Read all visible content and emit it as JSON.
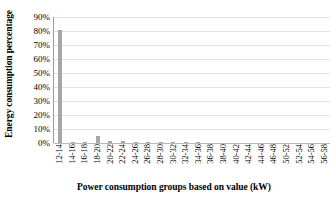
{
  "chart_data": {
    "type": "bar",
    "title": "",
    "subtitle": "",
    "xlabel": "Power consumption groups based on value (kW)",
    "ylabel": "Energy consumption percentage",
    "ylim": [
      0,
      90
    ],
    "ytick_labels": [
      "0%",
      "10%",
      "20%",
      "30%",
      "40%",
      "50%",
      "60%",
      "70%",
      "80%",
      "90%"
    ],
    "ytick_values": [
      0,
      10,
      20,
      30,
      40,
      50,
      60,
      70,
      80,
      90
    ],
    "grid": true,
    "legend": "none",
    "bar_color": "#a6a6a6",
    "categories": [
      "12-14",
      "14-16",
      "16-18",
      "18-20",
      "20-22",
      "22-24",
      "24-26",
      "26-28",
      "28-30",
      "30-32",
      "32-34",
      "34-36",
      "36-38",
      "38-40",
      "40-42",
      "42-44",
      "44-46",
      "46-48",
      "50-52",
      "52-54",
      "54-56",
      "56-58"
    ],
    "values": [
      81,
      1,
      1,
      5,
      1.2,
      1.2,
      0.8,
      1,
      0.8,
      0.8,
      0.4,
      0.4,
      0,
      0,
      0,
      0,
      0,
      0,
      0,
      0,
      0,
      0
    ],
    "series": [
      {
        "name": "Energy consumption percentage",
        "values": [
          81,
          1,
          1,
          5,
          1.2,
          1.2,
          0.8,
          1,
          0.8,
          0.8,
          0.4,
          0.4,
          0,
          0,
          0,
          0,
          0,
          0,
          0,
          0,
          0,
          0
        ]
      }
    ]
  }
}
